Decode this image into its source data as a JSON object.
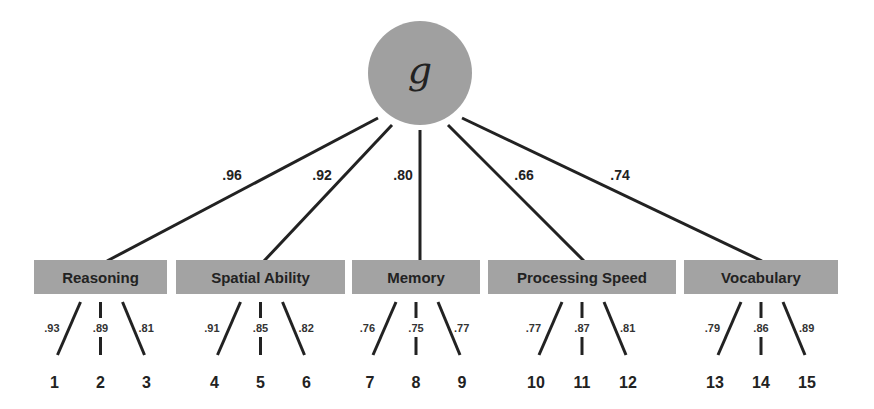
{
  "general_factor": {
    "label": "g",
    "fill": "#a0a0a0",
    "cx": 420,
    "cy": 73,
    "r": 52
  },
  "factors": [
    {
      "label": "Reasoning",
      "loading": ".96",
      "x": 34,
      "w": 133,
      "items": [
        {
          "num": "1",
          "loading": ".93"
        },
        {
          "num": "2",
          "loading": ".89"
        },
        {
          "num": "3",
          "loading": ".81"
        }
      ]
    },
    {
      "label": "Spatial Ability",
      "loading": ".92",
      "x": 176,
      "w": 169,
      "items": [
        {
          "num": "4",
          "loading": ".91"
        },
        {
          "num": "5",
          "loading": ".85"
        },
        {
          "num": "6",
          "loading": ".82"
        }
      ]
    },
    {
      "label": "Memory",
      "loading": ".80",
      "x": 352,
      "w": 128,
      "items": [
        {
          "num": "7",
          "loading": ".76"
        },
        {
          "num": "8",
          "loading": ".75"
        },
        {
          "num": "9",
          "loading": ".77"
        }
      ]
    },
    {
      "label": "Processing Speed",
      "loading": ".66",
      "x": 488,
      "w": 188,
      "items": [
        {
          "num": "10",
          "loading": ".77"
        },
        {
          "num": "11",
          "loading": ".87"
        },
        {
          "num": "12",
          "loading": ".81"
        }
      ]
    },
    {
      "label": "Vocabulary",
      "loading": ".74",
      "x": 684,
      "w": 154,
      "items": [
        {
          "num": "13",
          "loading": ".79"
        },
        {
          "num": "14",
          "loading": ".86"
        },
        {
          "num": "15",
          "loading": ".89"
        }
      ]
    }
  ],
  "colors": {
    "box_fill": "#a3a3a3",
    "line": "#222222",
    "text": "#222222"
  }
}
